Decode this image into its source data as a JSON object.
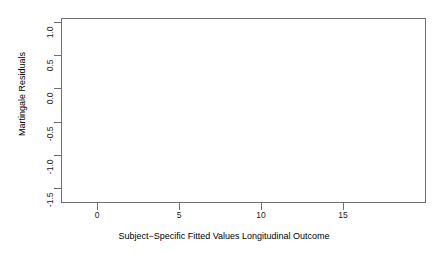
{
  "figure": {
    "background": "#ffffff",
    "frame_color": "#6f6f6f",
    "point_color": "#2b2b2b",
    "zero_line_color": "#4a4a4a",
    "smoother_color": "#b9b9b9"
  },
  "axes": {
    "x": {
      "title": "Subject−Specific Fitted Values Longitudinal Outcome",
      "ticks": [
        "0",
        "5",
        "10",
        "15"
      ],
      "tick_values": [
        0,
        5,
        10,
        15
      ],
      "range": [
        -1.8,
        20.5
      ]
    },
    "y": {
      "title": "Martingale Residuals",
      "ticks": [
        "1.0",
        "0.5",
        "0.0",
        "-0.5",
        "-1.0",
        "-1.5"
      ],
      "tick_values": [
        1.0,
        0.5,
        0.0,
        -0.5,
        -1.0,
        -1.5
      ],
      "range": [
        -1.78,
        1.13
      ]
    }
  },
  "chart_data": {
    "type": "scatter",
    "title": "",
    "xlabel": "Subject−Specific Fitted Values Longitudinal Outcome",
    "ylabel": "Martingale Residuals",
    "xlim": [
      -1.8,
      20.5
    ],
    "ylim": [
      -1.78,
      1.13
    ],
    "xticks": [
      0,
      5,
      10,
      15
    ],
    "yticks": [
      1.0,
      0.5,
      0.0,
      -0.5,
      -1.0,
      -1.5
    ],
    "grid": false,
    "legend": null,
    "marker": "open-circle",
    "marker_size": 3,
    "reference_lines": [
      {
        "name": "zero-line",
        "orientation": "horizontal",
        "y": 0.0,
        "color": "#4a4a4a"
      }
    ],
    "smoother": {
      "name": "loess-smoother",
      "color": "#b9b9b9",
      "points": [
        [
          -0.4,
          -0.4
        ],
        [
          0.3,
          -0.36
        ],
        [
          1.0,
          -0.33
        ],
        [
          1.8,
          -0.31
        ],
        [
          2.6,
          -0.29
        ],
        [
          3.4,
          -0.27
        ],
        [
          4.2,
          -0.25
        ]
      ]
    },
    "series": [
      {
        "name": "martingale-residuals",
        "n_points": 760,
        "description": "Upper cloud of positive residuals concentrated for fitted values 0-6 reaching +1.0; a dense dark band of negative residuals just under 0 that fans out between fitted values 0 and 6 and converges toward 0 beyond fitted value 10; sparse low outliers down to -1.7.",
        "points": [
          [
            -0.35,
            -0.5
          ],
          [
            -0.1,
            0.0
          ],
          [
            0.05,
            -1.7
          ],
          [
            0.2,
            -0.02
          ],
          [
            0.25,
            0.56
          ],
          [
            0.3,
            -0.3
          ],
          [
            0.35,
            0.18
          ],
          [
            0.4,
            -0.62
          ],
          [
            0.45,
            0.7
          ],
          [
            0.5,
            -0.88
          ],
          [
            0.55,
            0.3
          ],
          [
            0.6,
            -0.45
          ],
          [
            0.65,
            0.82
          ],
          [
            0.7,
            -1.1
          ],
          [
            0.75,
            0.05
          ],
          [
            0.8,
            -0.35
          ],
          [
            0.85,
            0.46
          ],
          [
            0.9,
            -0.72
          ],
          [
            0.95,
            0.62
          ],
          [
            1.0,
            -0.2
          ],
          [
            1.05,
            0.25
          ],
          [
            1.1,
            -0.95
          ],
          [
            1.15,
            0.88
          ],
          [
            1.2,
            -0.55
          ],
          [
            1.25,
            0.4
          ],
          [
            1.3,
            -0.28
          ],
          [
            1.35,
            0.68
          ],
          [
            1.4,
            -1.02
          ],
          [
            1.45,
            0.12
          ],
          [
            1.5,
            -0.42
          ],
          [
            1.55,
            0.76
          ],
          [
            1.6,
            -0.66
          ],
          [
            1.65,
            0.34
          ],
          [
            1.7,
            -0.18
          ],
          [
            1.75,
            0.92
          ],
          [
            1.8,
            -0.8
          ],
          [
            1.85,
            0.52
          ],
          [
            1.9,
            -0.36
          ],
          [
            1.95,
            0.22
          ],
          [
            2.0,
            -1.18
          ],
          [
            2.1,
            0.98
          ],
          [
            2.2,
            -0.48
          ],
          [
            2.3,
            0.6
          ],
          [
            2.4,
            -0.26
          ],
          [
            2.5,
            0.84
          ],
          [
            2.6,
            -0.7
          ],
          [
            2.7,
            0.38
          ],
          [
            2.8,
            -0.14
          ],
          [
            2.9,
            1.0
          ],
          [
            3.0,
            -0.58
          ],
          [
            3.1,
            0.72
          ],
          [
            3.2,
            -0.32
          ],
          [
            3.3,
            0.48
          ],
          [
            3.4,
            -0.86
          ],
          [
            3.5,
            0.9
          ],
          [
            3.6,
            -0.22
          ],
          [
            3.7,
            0.64
          ],
          [
            3.8,
            -0.44
          ],
          [
            3.9,
            0.3
          ],
          [
            4.0,
            -0.64
          ],
          [
            4.2,
            0.78
          ],
          [
            4.4,
            -0.24
          ],
          [
            4.6,
            0.54
          ],
          [
            4.8,
            -0.4
          ],
          [
            5.0,
            0.96
          ],
          [
            5.2,
            -0.16
          ],
          [
            5.4,
            0.42
          ],
          [
            5.6,
            -0.3
          ],
          [
            5.8,
            0.86
          ],
          [
            6.0,
            -0.12
          ],
          [
            6.5,
            0.58
          ],
          [
            7.0,
            -0.2
          ],
          [
            7.5,
            0.94
          ],
          [
            8.0,
            -0.1
          ],
          [
            8.5,
            0.66
          ],
          [
            9.0,
            -0.08
          ],
          [
            9.5,
            0.9
          ],
          [
            10.0,
            -0.06
          ],
          [
            11.0,
            0.92
          ],
          [
            12.0,
            -0.05
          ],
          [
            13.0,
            0.94
          ],
          [
            14.0,
            -0.04
          ],
          [
            15.0,
            0.95
          ],
          [
            16.0,
            -0.03
          ],
          [
            17.0,
            -0.03
          ],
          [
            18.0,
            -0.02
          ],
          [
            19.0,
            -0.02
          ]
        ]
      }
    ]
  }
}
